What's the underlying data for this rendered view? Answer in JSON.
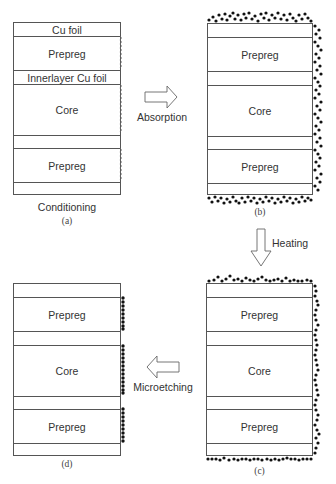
{
  "figure": {
    "panels": [
      {
        "id": "a",
        "sublabel": "(a)",
        "caption": "Conditioning",
        "layers": [
          "Cu foil",
          "Prepreg",
          "Innerlayer Cu foil",
          "Core",
          "",
          "Prepreg",
          ""
        ],
        "surface": "roughened-edge"
      },
      {
        "id": "b",
        "sublabel": "(b)",
        "layers": [
          "",
          "Prepreg",
          "",
          "Core",
          "",
          "Prepreg",
          ""
        ],
        "surface": "dense-particles-all-sides"
      },
      {
        "id": "c",
        "sublabel": "(c)",
        "layers": [
          "",
          "Prepreg",
          "",
          "Core",
          "",
          "Prepreg",
          ""
        ],
        "surface": "single-layer-particles-all-sides"
      },
      {
        "id": "d",
        "sublabel": "(d)",
        "layers": [
          "",
          "Prepreg",
          "",
          "Core",
          "",
          "Prepreg",
          ""
        ],
        "surface": "particles-on-dielectric-edges-only"
      }
    ],
    "arrows": [
      {
        "from": "a",
        "to": "b",
        "direction": "right",
        "label": "Absorption"
      },
      {
        "from": "b",
        "to": "c",
        "direction": "down",
        "label": "Heating"
      },
      {
        "from": "c",
        "to": "d",
        "direction": "left",
        "label": "Microetching"
      }
    ],
    "colors": {
      "line": "#555555",
      "particle": "#111111",
      "background": "#ffffff"
    }
  }
}
